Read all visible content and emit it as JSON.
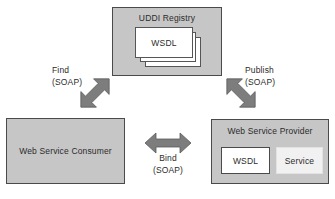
{
  "diagram": {
    "colors": {
      "node_fill": "#c6c6c6",
      "node_border": "#4a4a4a",
      "document_fill": "#ffffff",
      "service_fill": "#f1f1f1",
      "arrow_fill": "#7d7d7d",
      "arrow_border": "#5c5c5c",
      "text": "#2b2b2b",
      "background": "#ffffff"
    },
    "nodes": [
      {
        "id": "uddi-registry",
        "title": "UDDI Registry",
        "documents": [
          {
            "label": "WSDL"
          },
          {
            "label": ""
          },
          {
            "label": ""
          }
        ]
      },
      {
        "id": "consumer",
        "title": "Web Service Consumer"
      },
      {
        "id": "provider",
        "title": "Web Service Provider",
        "items": [
          {
            "id": "provider-wsdl",
            "label": "WSDL"
          },
          {
            "id": "provider-service",
            "label": "Service"
          }
        ]
      }
    ],
    "arrows": [
      {
        "id": "find",
        "operation": "Find",
        "protocol": "(SOAP)",
        "from": "Web Service Consumer",
        "to": "UDDI Registry",
        "direction": "bidirectional",
        "orientation": "diagonal-up-right"
      },
      {
        "id": "publish",
        "operation": "Publish",
        "protocol": "(SOAP)",
        "from": "Web Service Provider",
        "to": "UDDI Registry",
        "direction": "bidirectional",
        "orientation": "diagonal-up-left"
      },
      {
        "id": "bind",
        "operation": "Bind",
        "protocol": "(SOAP)",
        "from": "Web Service Consumer",
        "to": "Web Service Provider",
        "direction": "bidirectional",
        "orientation": "horizontal"
      }
    ]
  }
}
